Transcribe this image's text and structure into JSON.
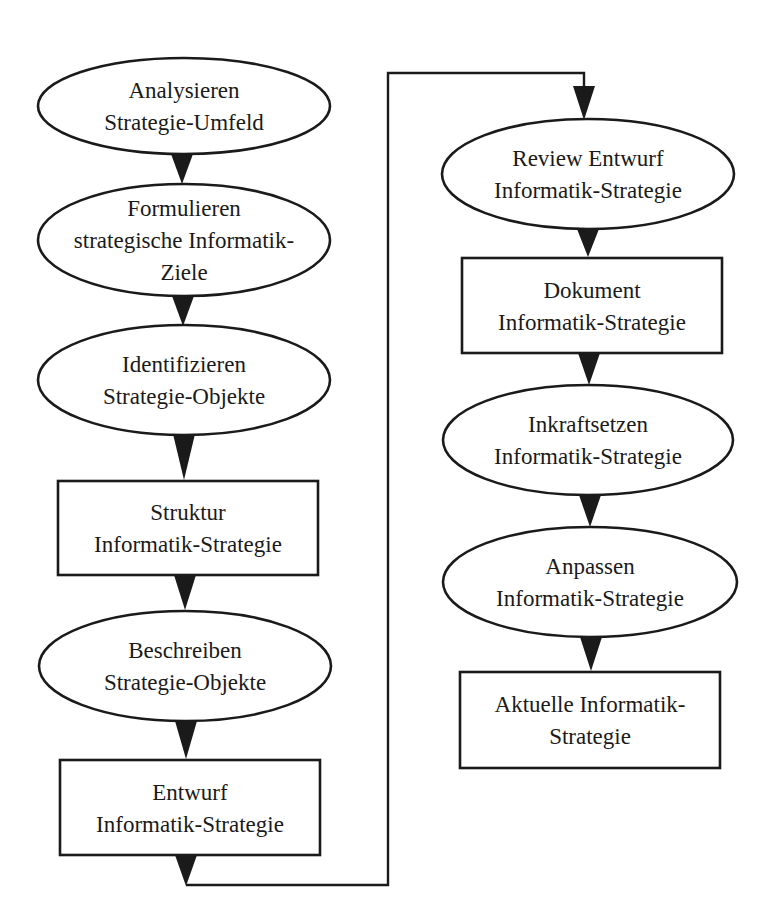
{
  "diagram": {
    "type": "flowchart",
    "colors": {
      "stroke": "#1a1a1a",
      "fill": "#ffffff",
      "text": "#1a1a1a"
    },
    "nodes": [
      {
        "id": "n1",
        "shape": "ellipse",
        "cx": 184,
        "cy": 106,
        "rx": 146,
        "ry": 48,
        "lines": [
          "Analysieren",
          "Strategie-Umfeld"
        ]
      },
      {
        "id": "n2",
        "shape": "ellipse",
        "cx": 184,
        "cy": 240,
        "rx": 146,
        "ry": 56,
        "lines": [
          "Formulieren",
          "strategische Informatik-",
          "Ziele"
        ]
      },
      {
        "id": "n3",
        "shape": "ellipse",
        "cx": 184,
        "cy": 380,
        "rx": 146,
        "ry": 55,
        "lines": [
          "Identifizieren",
          "Strategie-Objekte"
        ]
      },
      {
        "id": "n4",
        "shape": "rect",
        "x": 58,
        "y": 481,
        "w": 260,
        "h": 94,
        "lines": [
          "Struktur",
          "Informatik-Strategie"
        ]
      },
      {
        "id": "n5",
        "shape": "ellipse",
        "cx": 185,
        "cy": 666,
        "rx": 146,
        "ry": 55,
        "lines": [
          "Beschreiben",
          "Strategie-Objekte"
        ]
      },
      {
        "id": "n6",
        "shape": "rect",
        "x": 60,
        "y": 760,
        "w": 260,
        "h": 95,
        "lines": [
          "Entwurf",
          "Informatik-Strategie"
        ]
      },
      {
        "id": "n7",
        "shape": "ellipse",
        "cx": 588,
        "cy": 174,
        "rx": 146,
        "ry": 55,
        "lines": [
          "Review Entwurf",
          "Informatik-Strategie"
        ]
      },
      {
        "id": "n8",
        "shape": "rect",
        "x": 462,
        "y": 258,
        "w": 260,
        "h": 95,
        "lines": [
          "Dokument",
          "Informatik-Strategie"
        ]
      },
      {
        "id": "n9",
        "shape": "ellipse",
        "cx": 588,
        "cy": 440,
        "rx": 145,
        "ry": 55,
        "lines": [
          "Inkraftsetzen",
          "Informatik-Strategie"
        ]
      },
      {
        "id": "n10",
        "shape": "ellipse",
        "cx": 590,
        "cy": 582,
        "rx": 147,
        "ry": 55,
        "lines": [
          "Anpassen",
          "Informatik-Strategie"
        ]
      },
      {
        "id": "n11",
        "shape": "rect",
        "x": 460,
        "y": 672,
        "w": 260,
        "h": 96,
        "lines": [
          "Aktuelle Informatik-",
          "Strategie"
        ]
      }
    ],
    "edges": [
      {
        "from": "n1",
        "to": "n2",
        "arrow": {
          "x": 182,
          "y1": 154,
          "y2": 184
        }
      },
      {
        "from": "n2",
        "to": "n3",
        "arrow": {
          "x": 183,
          "y1": 296,
          "y2": 326
        }
      },
      {
        "from": "n3",
        "to": "n4",
        "arrow": {
          "x": 184,
          "y1": 434,
          "y2": 480
        }
      },
      {
        "from": "n4",
        "to": "n5",
        "arrow": {
          "x": 185,
          "y1": 575,
          "y2": 610
        }
      },
      {
        "from": "n5",
        "to": "n6",
        "arrow": {
          "x": 186,
          "y1": 721,
          "y2": 759
        }
      },
      {
        "from": "n6",
        "to": "n7",
        "path": [
          [
            186,
            885
          ],
          [
            388,
            885
          ],
          [
            388,
            73
          ],
          [
            584,
            73
          ],
          [
            584,
            90
          ]
        ],
        "arrow": {
          "x": 584,
          "y1": 86,
          "y2": 120
        },
        "start_arrow": {
          "x": 186,
          "y1": 855,
          "y2": 886
        }
      },
      {
        "from": "n7",
        "to": "n8",
        "arrow": {
          "x": 588,
          "y1": 229,
          "y2": 257
        }
      },
      {
        "from": "n8",
        "to": "n9",
        "arrow": {
          "x": 589,
          "y1": 353,
          "y2": 385
        }
      },
      {
        "from": "n9",
        "to": "n10",
        "arrow": {
          "x": 590,
          "y1": 495,
          "y2": 527
        }
      },
      {
        "from": "n10",
        "to": "n11",
        "arrow": {
          "x": 591,
          "y1": 637,
          "y2": 671
        }
      }
    ]
  }
}
